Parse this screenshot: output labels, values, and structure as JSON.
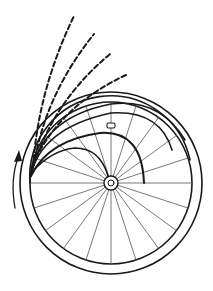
{
  "diagram": {
    "title": "",
    "background": "#ffffff",
    "stroke_color": "#1a1a1a",
    "wheel": {
      "center": [
        111,
        183
      ],
      "tire_outer_radius": 91,
      "rim_radius": 81,
      "hub_outer_radius": 7,
      "hub_inner_radius": 3,
      "spoke_count": 20,
      "valve_marker": [
        111,
        126
      ]
    },
    "solid_arcs": [
      {
        "label": "trajectory-1"
      },
      {
        "label": "trajectory-2"
      },
      {
        "label": "trajectory-3"
      },
      {
        "label": "trajectory-4"
      },
      {
        "label": "trajectory-5"
      }
    ],
    "dashed_arcs": [
      {
        "label": "dashed-trajectory-1",
        "end": [
          74,
          16
        ]
      },
      {
        "label": "dashed-trajectory-2",
        "end": [
          94,
          34
        ]
      },
      {
        "label": "dashed-trajectory-3",
        "end": [
          110,
          54
        ]
      },
      {
        "label": "dashed-trajectory-4",
        "end": [
          126,
          75
        ]
      }
    ],
    "rotation_arrow": {
      "direction": "counterclockwise"
    }
  }
}
